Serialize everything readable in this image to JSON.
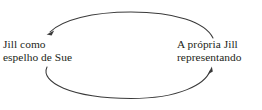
{
  "figure": {
    "type": "cycle-diagram",
    "background_color": "#ffffff",
    "stroke_color": "#3a3a3a",
    "text_color": "#231f20"
  },
  "nodes": {
    "left": {
      "line1": "Jill como",
      "line2": "espelho de Sue"
    },
    "right": {
      "line1": "A própria Jill",
      "line2": "representando"
    }
  },
  "arrows": {
    "top": {
      "name": "arrow-right-to-left",
      "direction": "from right node to left node",
      "arrowhead_at": "left"
    },
    "bottom": {
      "name": "arrow-left-to-right",
      "direction": "from left node to right node",
      "arrowhead_at": "right"
    }
  }
}
